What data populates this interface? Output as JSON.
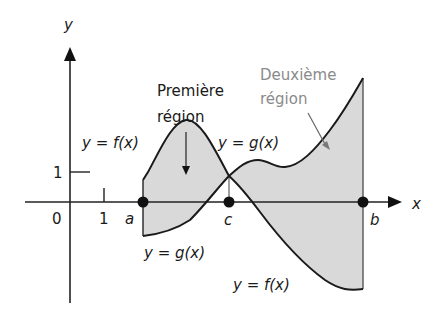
{
  "axes": {
    "x_label": "x",
    "y_label": "y",
    "origin_label": "0",
    "x_tick_label": "1",
    "y_tick_label": "1"
  },
  "points": {
    "a": "a",
    "b": "b",
    "c": "c"
  },
  "labels": {
    "f_upper": "y = f(x)",
    "g_upper": "y = g(x)",
    "g_lower": "y = g(x)",
    "f_lower": "y = f(x)",
    "region1_line1": "Première",
    "region1_line2": "région",
    "region2_line1": "Deuxième",
    "region2_line2": "région"
  },
  "colors": {
    "curve": "#1a1a1a",
    "shade": "#d9d9d9",
    "axis": "#222222",
    "region2_text": "#8a8a8a"
  }
}
